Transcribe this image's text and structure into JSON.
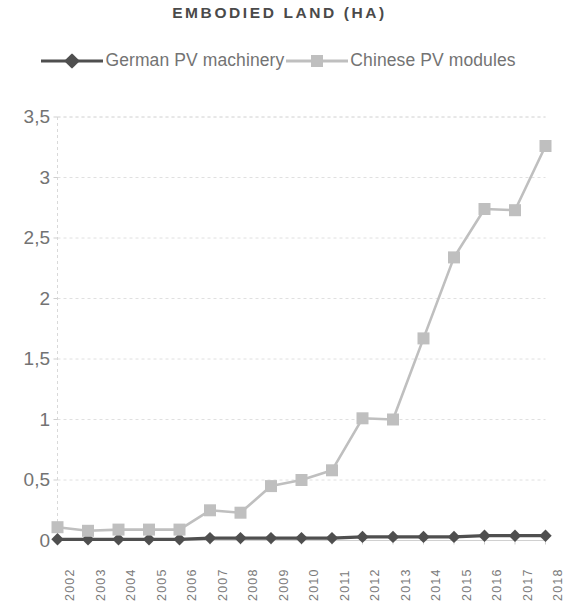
{
  "chart_data": {
    "type": "line",
    "title": "EMBODIED LAND (HA)",
    "xlabel": "",
    "ylabel": "",
    "categories": [
      "2002",
      "2003",
      "2004",
      "2005",
      "2006",
      "2007",
      "2008",
      "2009",
      "2010",
      "2011",
      "2012",
      "2013",
      "2014",
      "2015",
      "2016",
      "2017",
      "2018"
    ],
    "series": [
      {
        "name": "German PV machinery",
        "color": "#4f4f4f",
        "marker": "diamond",
        "values": [
          0.01,
          0.01,
          0.01,
          0.01,
          0.01,
          0.02,
          0.02,
          0.02,
          0.02,
          0.02,
          0.03,
          0.03,
          0.03,
          0.03,
          0.04,
          0.04,
          0.04
        ]
      },
      {
        "name": "Chinese PV modules",
        "color": "#bfbfbf",
        "marker": "square",
        "values": [
          0.11,
          0.08,
          0.09,
          0.09,
          0.09,
          0.25,
          0.23,
          0.45,
          0.5,
          0.58,
          1.01,
          1.0,
          1.67,
          2.34,
          2.74,
          2.73,
          3.26
        ]
      }
    ],
    "ylim": [
      0,
      3.5
    ],
    "ytick_labels": [
      "0",
      "0,5",
      "1",
      "1,5",
      "2",
      "2,5",
      "3",
      "3,5"
    ],
    "ytick_values": [
      0,
      0.5,
      1,
      1.5,
      2,
      2.5,
      3,
      3.5
    ],
    "grid": "horizontal-dotted",
    "legend_position": "top",
    "axis_color": "#d9d9d9",
    "grid_color": "#e0e0e0",
    "text_color": "#737373"
  },
  "legend": {
    "items": [
      {
        "label": "German PV machinery",
        "marker": "diamond-marker-icon"
      },
      {
        "label": "Chinese PV modules",
        "marker": "square-marker-icon"
      }
    ]
  }
}
